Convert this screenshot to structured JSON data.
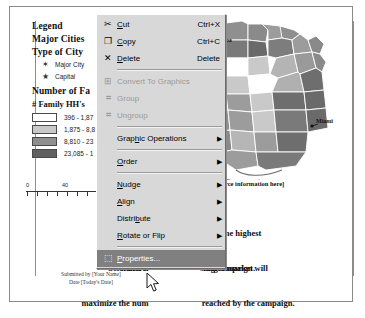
{
  "document": {
    "legend": {
      "title": "Legend",
      "major_cities_heading": "Major Cities",
      "type_of_city_heading": "Type of City",
      "city_types": [
        {
          "symbol": "✶",
          "label": "Major City"
        },
        {
          "symbol": "★",
          "label": "Capital"
        }
      ],
      "number_heading": "Number of Fa",
      "family_heading": "# Family HH's",
      "classes": [
        {
          "color": "#ffffff",
          "range": "396 - 1,87"
        },
        {
          "color": "#c9c9c9",
          "range": "1,875 - 8,8"
        },
        {
          "color": "#8f8f8f",
          "range": "8,810 - 23"
        },
        {
          "color": "#606060",
          "range": "23,085 - 1"
        }
      ]
    },
    "scalebar": {
      "ticks": [
        "0",
        "40",
        "80"
      ]
    },
    "map": {
      "labels": [
        {
          "name": "Tampa",
          "text": "Tampa"
        },
        {
          "name": "Miami",
          "text": "Miami"
        }
      ]
    },
    "source_note": "[Enter source information here]",
    "paragraphs": {
      "p1_line1": "The coun                          with the highest",
      "p1_line2": "number                         target market.",
      "p2_line1": "Selection o                         sing campaign will",
      "p2_line2": "maximize the num                         reached by the campaign."
    },
    "submitted": {
      "line1": "Submitted by [Your Name]",
      "line2": "Date [Today's Date]"
    }
  },
  "context_menu": {
    "items": [
      {
        "name": "cut",
        "icon": "scissors-icon",
        "glyph": "✂",
        "label": "Cut",
        "underline": "C",
        "accel": "Ctrl+X",
        "submenu": false,
        "disabled": false,
        "selected": false
      },
      {
        "name": "copy",
        "icon": "copy-icon",
        "glyph": "❐",
        "label": "Copy",
        "underline": "C",
        "accel": "Ctrl+C",
        "submenu": false,
        "disabled": false,
        "selected": false
      },
      {
        "name": "delete",
        "icon": "x-icon",
        "glyph": "✕",
        "label": "Delete",
        "underline": "D",
        "accel": "Delete",
        "submenu": false,
        "disabled": false,
        "selected": false
      },
      {
        "name": "separator-1",
        "separator": true
      },
      {
        "name": "convert-to-graphics",
        "icon": "convert-icon",
        "glyph": "⊞",
        "label": "Convert To Graphics",
        "underline": "",
        "accel": "",
        "submenu": false,
        "disabled": true,
        "selected": false
      },
      {
        "name": "group",
        "icon": "group-icon",
        "glyph": "⌗",
        "label": "Group",
        "underline": "",
        "accel": "",
        "submenu": false,
        "disabled": true,
        "selected": false
      },
      {
        "name": "ungroup",
        "icon": "ungroup-icon",
        "glyph": "⌗",
        "label": "Ungroup",
        "underline": "",
        "accel": "",
        "submenu": false,
        "disabled": true,
        "selected": false
      },
      {
        "name": "separator-2",
        "separator": true
      },
      {
        "name": "graphic-operations",
        "icon": "",
        "glyph": "",
        "label": "Graphic Operations",
        "underline": "h",
        "accel": "",
        "submenu": true,
        "disabled": false,
        "selected": false
      },
      {
        "name": "separator-3",
        "separator": true
      },
      {
        "name": "order",
        "icon": "",
        "glyph": "",
        "label": "Order",
        "underline": "O",
        "accel": "",
        "submenu": true,
        "disabled": false,
        "selected": false
      },
      {
        "name": "separator-4",
        "separator": true
      },
      {
        "name": "nudge",
        "icon": "",
        "glyph": "",
        "label": "Nudge",
        "underline": "N",
        "accel": "",
        "submenu": true,
        "disabled": false,
        "selected": false
      },
      {
        "name": "align",
        "icon": "",
        "glyph": "",
        "label": "Align",
        "underline": "A",
        "accel": "",
        "submenu": true,
        "disabled": false,
        "selected": false
      },
      {
        "name": "distribute",
        "icon": "",
        "glyph": "",
        "label": "Distribute",
        "underline": "b",
        "accel": "",
        "submenu": true,
        "disabled": false,
        "selected": false
      },
      {
        "name": "rotate-or-flip",
        "icon": "",
        "glyph": "",
        "label": "Rotate or Flip",
        "underline": "R",
        "accel": "",
        "submenu": true,
        "disabled": false,
        "selected": false
      },
      {
        "name": "separator-5",
        "separator": true
      },
      {
        "name": "properties",
        "icon": "properties-icon",
        "glyph": "⬚",
        "label": "Properties...",
        "underline": "P",
        "accel": "",
        "submenu": false,
        "disabled": false,
        "selected": true
      }
    ]
  },
  "colors": {
    "menu_background": "#d8d8d8",
    "menu_selected": "#808080",
    "menu_disabled_text": "#9a9a9a",
    "page_border": "#8a8a8a"
  }
}
